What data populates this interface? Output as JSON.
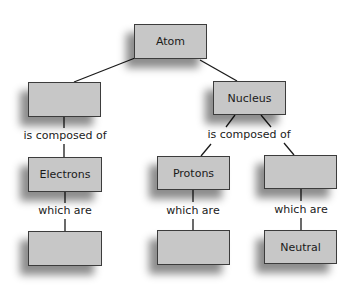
{
  "diagram": {
    "type": "concept-map",
    "nodes": {
      "atom": {
        "label": "Atom"
      },
      "left_blank": {
        "label": ""
      },
      "nucleus": {
        "label": "Nucleus"
      },
      "electrons": {
        "label": "Electrons"
      },
      "protons": {
        "label": "Protons"
      },
      "right_blank": {
        "label": ""
      },
      "electrons_property": {
        "label": ""
      },
      "protons_property": {
        "label": ""
      },
      "neutral": {
        "label": "Neutral"
      }
    },
    "linking_phrases": {
      "left_composed": "is composed of",
      "nucleus_composed": "is composed of",
      "electrons_which": "which are",
      "protons_which": "which are",
      "right_which": "which are"
    },
    "colors": {
      "box_fill": "#c7c7c7",
      "box_border": "#3c3c3c",
      "line": "#1a1a1a"
    }
  }
}
